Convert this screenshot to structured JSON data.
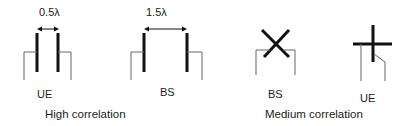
{
  "diagram": {
    "groups": [
      {
        "caption": "High correlation",
        "configs": [
          {
            "label": "UE",
            "spacing_label": "0.5λ",
            "type": "uniform-linear-array",
            "elements": 2
          },
          {
            "label": "BS",
            "spacing_label": "1.5λ",
            "type": "uniform-linear-array",
            "elements": 2
          }
        ]
      },
      {
        "caption": "Medium correlation",
        "configs": [
          {
            "label": "BS",
            "type": "cross-polarized",
            "elements": 2
          },
          {
            "label": "UE",
            "type": "cross-polarized",
            "elements": 2
          }
        ]
      }
    ],
    "colors": {
      "thick_line": "#111111",
      "thin_line": "#666666",
      "text": "#1a1a1a"
    }
  }
}
